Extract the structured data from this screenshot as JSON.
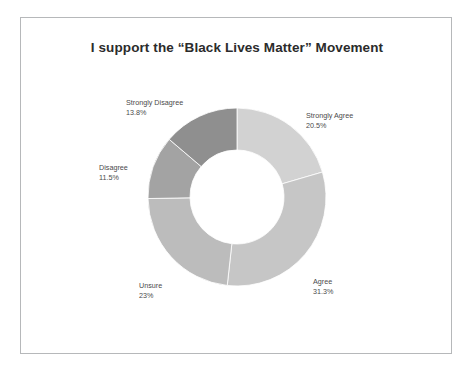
{
  "chart_data": {
    "type": "pie",
    "variant": "donut",
    "title": "I support the “Black Lives Matter” Movement",
    "xlabel": "",
    "ylabel": "",
    "legend": "none",
    "grid": false,
    "start_angle_deg": 0,
    "direction": "clockwise",
    "units": "percent",
    "categories": [
      "Strongly Agree",
      "Agree",
      "Unsure",
      "Disagree",
      "Strongly Disagree"
    ],
    "values": [
      20.5,
      31.3,
      23,
      11.5,
      13.8
    ],
    "labels": [
      "20.5%",
      "31.3%",
      "23%",
      "11.5%",
      "13.8%"
    ],
    "colors": [
      "#d2d2d2",
      "#c6c6c6",
      "#bcbcbc",
      "#a3a3a3",
      "#8f8f8f"
    ],
    "slices": [
      {
        "name": "Strongly Agree",
        "value": 20.5,
        "label": "20.5%",
        "color": "#d2d2d2"
      },
      {
        "name": "Agree",
        "value": 31.3,
        "label": "31.3%",
        "color": "#c6c6c6"
      },
      {
        "name": "Unsure",
        "value": 23,
        "label": "23%",
        "color": "#bcbcbc"
      },
      {
        "name": "Disagree",
        "value": 11.5,
        "label": "11.5%",
        "color": "#a3a3a3"
      },
      {
        "name": "Strongly Disagree",
        "value": 13.8,
        "label": "13.8%",
        "color": "#8f8f8f"
      }
    ]
  },
  "frame": {
    "border_color": "#b6b8ba",
    "background": "#ffffff"
  },
  "geometry": {
    "cx": 216,
    "cy": 179,
    "outer_radius": 89,
    "inner_radius": 47
  }
}
